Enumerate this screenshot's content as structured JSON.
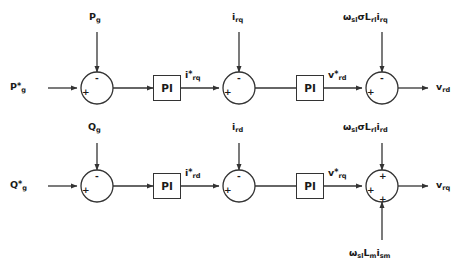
{
  "diagram": {
    "line_color": "#333333",
    "text_color": "#1a1a1a",
    "background": "#ffffff"
  },
  "blocks": {
    "pi_top_left": "PI",
    "pi_top_right": "PI",
    "pi_bottom_left": "PI",
    "pi_bottom_right": "PI"
  },
  "signs": {
    "sum1_plus": "+",
    "sum1_minus": "-",
    "sum2_plus": "+",
    "sum2_minus": "-",
    "sum3_plus": "+",
    "sum3_minus": "-",
    "sum4_plus": "+",
    "sum4_minus": "-",
    "sum5_plus": "+",
    "sum5_minus": "-",
    "sum6_left_plus": "+",
    "sum6_top_plus": "+",
    "sum6_bottom_plus": "+"
  },
  "labels": {
    "p_ref": {
      "base": "P",
      "star": "*",
      "sub": "g"
    },
    "p_feedback": {
      "base": "P",
      "sub": "g"
    },
    "q_ref": {
      "base": "Q",
      "star": "*",
      "sub": "g"
    },
    "q_feedback": {
      "base": "Q",
      "sub": "g"
    },
    "i_rq_feedback": {
      "base": "i",
      "sub": "rq"
    },
    "i_rd_feedback": {
      "base": "i",
      "sub": "rd"
    },
    "i_rq_ref": {
      "base": "i",
      "star": "*",
      "sub": "rq"
    },
    "i_rd_ref": {
      "base": "i",
      "star": "*",
      "sub": "rd"
    },
    "v_rd_ref": {
      "base": "v",
      "star": "*",
      "sub": "rd"
    },
    "v_rq_ref": {
      "base": "v",
      "star": "*",
      "sub": "rq"
    },
    "v_rd_out": {
      "base": "v",
      "sub": "rd"
    },
    "v_rq_out": {
      "base": "v",
      "sub": "rq"
    },
    "comp_top": "ωslσLrlirq",
    "comp_mid": "ωslσLrlird",
    "comp_bottom": "ωslLmism"
  },
  "decoupling_terms": {
    "top": {
      "omega": "ω",
      "omega_sub": "sl",
      "sigma": "σ",
      "l": "L",
      "l_sub": "rl",
      "i": "i",
      "i_sub": "rq"
    },
    "mid": {
      "omega": "ω",
      "omega_sub": "sl",
      "sigma": "σ",
      "l": "L",
      "l_sub": "rl",
      "i": "i",
      "i_sub": "rd"
    },
    "bottom": {
      "omega": "ω",
      "omega_sub": "sl",
      "l": "L",
      "l_sub": "m",
      "i": "i",
      "i_sub": "sm"
    }
  }
}
